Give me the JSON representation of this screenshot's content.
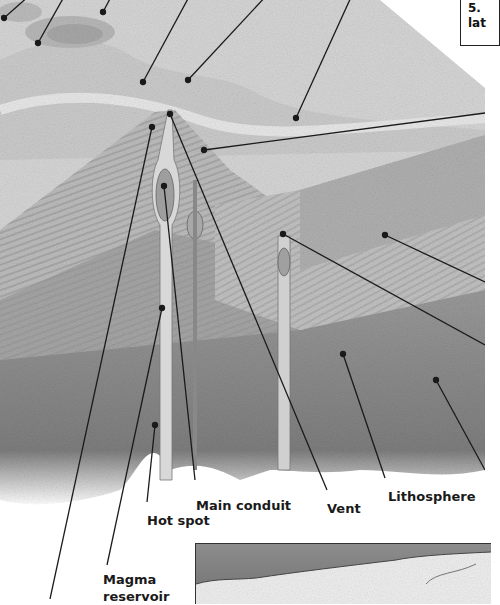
{
  "diagram": {
    "style": "grayscale illustration",
    "colors": {
      "background": "#ffffff",
      "sky_light": "#e6e6e6",
      "surface": "#d2d2d2",
      "strata_light": "#c4c4c4",
      "strata_mid": "#a8a8a8",
      "lithosphere": "#8e8e8e",
      "deep": "#7a7a7a",
      "leader_line": "#1a1a1a",
      "inset_band": "#8a8a8a"
    }
  },
  "labels": {
    "hot_spot": "Hot spot",
    "main_conduit": "Main conduit",
    "vent": "Vent",
    "lithosphere": "Lithosphere",
    "magma_line1": "Magma",
    "magma_line2": "reservoir"
  },
  "callout": {
    "line1": "5.",
    "line2": "lat"
  },
  "leaders": [
    {
      "target": "top-left-peak",
      "dot": [
        4,
        18
      ],
      "to": [
        30,
        -5
      ]
    },
    {
      "target": "top-left-crater-1",
      "dot": [
        38,
        43
      ],
      "to": [
        65,
        -5
      ]
    },
    {
      "target": "top-left-crater-2",
      "dot": [
        103,
        12
      ],
      "to": [
        112,
        -5
      ]
    },
    {
      "target": "summit-left",
      "dot": [
        143,
        82
      ],
      "to": [
        190,
        -5
      ]
    },
    {
      "target": "summit-right",
      "dot": [
        188,
        80
      ],
      "to": [
        267,
        -5
      ]
    },
    {
      "target": "flank-plain",
      "dot": [
        296,
        118
      ],
      "to": [
        352,
        -5
      ]
    },
    {
      "target": "side-slope",
      "dot": [
        204,
        150
      ],
      "to": [
        485,
        113
      ]
    },
    {
      "target": "strata-right",
      "dot": [
        385,
        235
      ],
      "to": [
        485,
        282
      ]
    },
    {
      "target": "secondary-vent",
      "dot": [
        283,
        234
      ],
      "to": [
        485,
        345
      ]
    },
    {
      "target": "deep-right",
      "dot": [
        436,
        380
      ],
      "to": [
        485,
        470
      ]
    },
    {
      "target": "lithosphere-dot",
      "dot": [
        343,
        354
      ],
      "to": [
        385,
        478
      ]
    },
    {
      "target": "vent-line",
      "dot": [
        170,
        114
      ],
      "to": [
        327,
        490
      ]
    },
    {
      "target": "main-conduit",
      "dot": [
        164,
        186
      ],
      "to": [
        195,
        480
      ]
    },
    {
      "target": "hot-spot",
      "dot": [
        155,
        425
      ],
      "to": [
        147,
        502
      ]
    },
    {
      "target": "magma-reservoir-a",
      "dot": [
        152,
        127
      ],
      "to": [
        50,
        599
      ]
    },
    {
      "target": "magma-reservoir-b",
      "dot": [
        162,
        308
      ],
      "to": [
        107,
        565
      ]
    }
  ]
}
